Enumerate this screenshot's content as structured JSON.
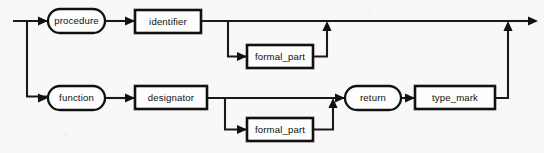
{
  "diagram": {
    "kind": "railroad-syntax-diagram",
    "background_color": "#f8f8f8",
    "line_color": "#1a1a1a",
    "box_fill": "#fdfdfd",
    "nodes": [
      {
        "id": "procedure",
        "label": "procedure",
        "shape": "oval",
        "x": 48,
        "y": 9,
        "w": 57,
        "h": 24
      },
      {
        "id": "identifier",
        "label": "identifier",
        "shape": "box",
        "x": 135,
        "y": 10,
        "w": 66,
        "h": 23
      },
      {
        "id": "formal_part_upper",
        "label": "formal_part",
        "shape": "box",
        "x": 247,
        "y": 45,
        "w": 66,
        "h": 23
      },
      {
        "id": "function",
        "label": "function",
        "shape": "oval",
        "x": 48,
        "y": 86,
        "w": 57,
        "h": 24
      },
      {
        "id": "designator",
        "label": "designator",
        "shape": "box",
        "x": 135,
        "y": 86,
        "w": 72,
        "h": 23
      },
      {
        "id": "formal_part_lower",
        "label": "formal_part",
        "shape": "box",
        "x": 247,
        "y": 118,
        "w": 66,
        "h": 23
      },
      {
        "id": "return",
        "label": "return",
        "shape": "oval",
        "x": 345,
        "y": 86,
        "w": 56,
        "h": 24
      },
      {
        "id": "type_mark",
        "label": "type_mark",
        "shape": "box",
        "x": 415,
        "y": 86,
        "w": 80,
        "h": 23
      }
    ],
    "labels": {
      "procedure": "procedure",
      "identifier": "identifier",
      "formal_part_upper": "formal_part",
      "function": "function",
      "designator": "designator",
      "formal_part_lower": "formal_part",
      "return": "return",
      "type_mark": "type_mark"
    },
    "paths": {
      "entry": "entry-line",
      "upper_branch": "procedure-branch",
      "lower_branch": "function-branch",
      "upper_optional_loop": "formal-part-upper-loop",
      "lower_optional_loop": "formal-part-lower-loop",
      "return_join": "type-mark-to-exit",
      "exit": "exit-arrow"
    }
  }
}
